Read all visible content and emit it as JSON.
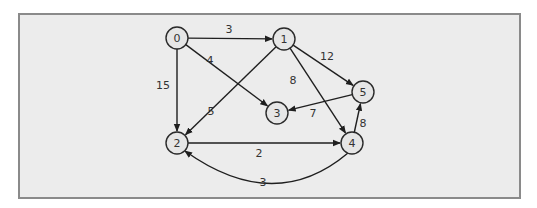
{
  "diagram": {
    "type": "directed-weighted-graph",
    "nodes": [
      {
        "id": "0",
        "label": "0",
        "x": 177,
        "y": 38
      },
      {
        "id": "1",
        "label": "1",
        "x": 284,
        "y": 39
      },
      {
        "id": "2",
        "label": "2",
        "x": 177,
        "y": 143
      },
      {
        "id": "3",
        "label": "3",
        "x": 277,
        "y": 113
      },
      {
        "id": "4",
        "label": "4",
        "x": 352,
        "y": 143
      },
      {
        "id": "5",
        "label": "5",
        "x": 363,
        "y": 92
      }
    ],
    "edges": [
      {
        "from": "0",
        "to": "1",
        "weight": "3",
        "label_x": 229,
        "label_y": 33
      },
      {
        "from": "0",
        "to": "3",
        "weight": "4",
        "label_x": 210,
        "label_y": 64
      },
      {
        "from": "0",
        "to": "2",
        "weight": "15",
        "label_x": 163,
        "label_y": 89
      },
      {
        "from": "1",
        "to": "2",
        "weight": "5",
        "label_x": 211,
        "label_y": 115
      },
      {
        "from": "1",
        "to": "4",
        "weight": "8",
        "label_x": 293,
        "label_y": 84
      },
      {
        "from": "1",
        "to": "5",
        "weight": "12",
        "label_x": 327,
        "label_y": 60
      },
      {
        "from": "5",
        "to": "3",
        "weight": "7",
        "label_x": 313,
        "label_y": 117
      },
      {
        "from": "4",
        "to": "5",
        "weight": "8",
        "label_x": 363,
        "label_y": 127
      },
      {
        "from": "2",
        "to": "4",
        "weight": "2",
        "label_x": 259,
        "label_y": 157
      },
      {
        "from": "4",
        "to": "2",
        "weight": "3",
        "label_x": 263,
        "label_y": 186,
        "curved": true
      }
    ]
  }
}
